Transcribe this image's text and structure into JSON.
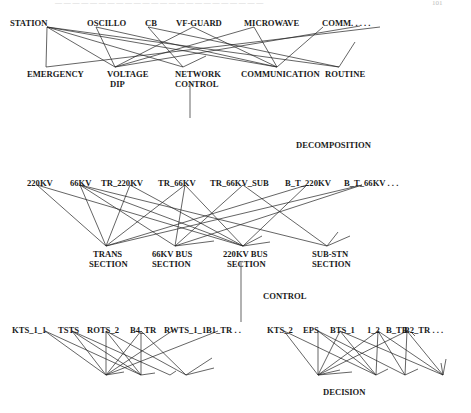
{
  "header": {
    "text": "— — — — — — — — — — — — — — — — — — — — — — — —",
    "page_number": "101"
  },
  "colors": {
    "line": "#222222",
    "text": "#1a1a1a",
    "background": "#ffffff"
  },
  "stages": {
    "decomposition": "DECOMPOSITION",
    "control": "CONTROL",
    "decision": "DECISION"
  },
  "level1": {
    "top_nodes": [
      {
        "id": "station",
        "label": "STATION",
        "x": 10,
        "ax": 47
      },
      {
        "id": "oscillo",
        "label": "OSCILLO",
        "x": 87,
        "ax": 96
      },
      {
        "id": "cb",
        "label": "CB",
        "x": 145,
        "ax": 148
      },
      {
        "id": "vfguard",
        "label": "VF-GUARD",
        "x": 176,
        "ax": 193
      },
      {
        "id": "microwave",
        "label": "MICROWAVE",
        "x": 244,
        "ax": 254
      },
      {
        "id": "comm",
        "label": "COMM. . . . .",
        "x": 322,
        "ax": 323
      }
    ],
    "top_y": 26,
    "bottom_nodes": [
      {
        "id": "emergency",
        "label": "EMERGENCY",
        "line2": "",
        "x": 27,
        "ax": 46
      },
      {
        "id": "voltage-dip",
        "label": "VOLTAGE",
        "line2": "DIP",
        "x": 107,
        "ax": 115
      },
      {
        "id": "network-control",
        "label": "NETWORK",
        "line2": "CONTROL",
        "x": 175,
        "ax": 183
      },
      {
        "id": "communication",
        "label": "COMMUNICATION",
        "line2": "",
        "x": 241,
        "ax": 277
      },
      {
        "id": "routine",
        "label": "ROUTINE",
        "line2": "",
        "x": 325,
        "ax": 339
      }
    ],
    "bottom_y": 76,
    "node_y": 67,
    "edges": [
      [
        47,
        26,
        46,
        67
      ],
      [
        47,
        26,
        115,
        67
      ],
      [
        47,
        26,
        183,
        67
      ],
      [
        47,
        26,
        277,
        67
      ],
      [
        47,
        26,
        339,
        67
      ],
      [
        96,
        26,
        115,
        67
      ],
      [
        96,
        26,
        183,
        67
      ],
      [
        148,
        26,
        183,
        67
      ],
      [
        148,
        26,
        339,
        67
      ],
      [
        193,
        26,
        115,
        67
      ],
      [
        193,
        26,
        277,
        67
      ],
      [
        254,
        26,
        115,
        67
      ],
      [
        254,
        26,
        277,
        67
      ],
      [
        360,
        26,
        115,
        67
      ],
      [
        323,
        26,
        277,
        67
      ],
      [
        193,
        26,
        9999,
        9999
      ]
    ],
    "stubs": [
      [
        183,
        67,
        206,
        56
      ],
      [
        339,
        67,
        355,
        42
      ],
      [
        380,
        27,
        70,
        62
      ]
    ]
  },
  "connector1": {
    "x": 190,
    "y1": 83,
    "y2": 118
  },
  "level2": {
    "top_nodes": [
      {
        "id": "220kv",
        "label": "220KV",
        "x": 27,
        "ax": 37
      },
      {
        "id": "66kv",
        "label": "66KV",
        "x": 70,
        "ax": 80
      },
      {
        "id": "tr-220kv",
        "label": "TR_220KV",
        "x": 101,
        "ax": 130
      },
      {
        "id": "tr-66kv",
        "label": "TR_66KV",
        "x": 158,
        "ax": 185
      },
      {
        "id": "tr-66kv-sub",
        "label": "TR_66KV_SUB",
        "x": 210,
        "ax": 243
      },
      {
        "id": "b-t-220kv",
        "label": "B_T_220KV",
        "x": 285,
        "ax": 307
      },
      {
        "id": "b-t-66kv",
        "label": "B_T_66KV . . .",
        "x": 344,
        "ax": 362
      }
    ],
    "top_y": 183,
    "bottom_nodes": [
      {
        "id": "trans-section",
        "label": "TRANS",
        "line2": "SECTION",
        "x": 106,
        "ax": 106
      },
      {
        "id": "66kv-bus-section",
        "label": "66KV BUS",
        "line2": "SECTION",
        "x": 175,
        "ax": 175
      },
      {
        "id": "220kv-bus-section",
        "label": "220KV BUS",
        "line2": "SECTION",
        "x": 243,
        "ax": 243
      },
      {
        "id": "sub-stn-section",
        "label": "SUB-STN",
        "line2": "SECTION",
        "x": 327,
        "ax": 327
      }
    ],
    "node_y": 246,
    "bottom_y": 257
  },
  "connector2": {
    "x": 241,
    "y1": 262,
    "y2": 322
  },
  "level3": {
    "left_top": [
      {
        "id": "kts-1-1",
        "label": "KTS_1_1",
        "x": 12,
        "ax": 45
      },
      {
        "id": "tsts",
        "label": "TSTS",
        "x": 58,
        "ax": 72
      },
      {
        "id": "rots-2",
        "label": "ROTS_2",
        "x": 87,
        "ax": 106
      },
      {
        "id": "b4-tr",
        "label": "B4_TR",
        "x": 130,
        "ax": 141
      },
      {
        "id": "rwts-1-1",
        "label": "RWTS_1_1",
        "x": 164,
        "ax": 172
      },
      {
        "id": "b1-tr",
        "label": "B1_TR . .",
        "x": 206,
        "ax": 218
      }
    ],
    "right_top": [
      {
        "id": "kts-2",
        "label": "KTS_2",
        "x": 267,
        "ax": 284
      },
      {
        "id": "eps",
        "label": "EPS",
        "x": 303,
        "ax": 318
      },
      {
        "id": "bts-1",
        "label": "BTS_1",
        "x": 330,
        "ax": 340
      },
      {
        "id": "1-2",
        "label": "1_2",
        "x": 366,
        "ax": 378
      },
      {
        "id": "b-tb",
        "label": "B_TB",
        "x": 386,
        "ax": 407
      },
      {
        "id": "b2-tr",
        "label": "B2_TR . . .",
        "x": 404,
        "ax": 408
      }
    ],
    "top_y": 333,
    "node_y": 375
  }
}
